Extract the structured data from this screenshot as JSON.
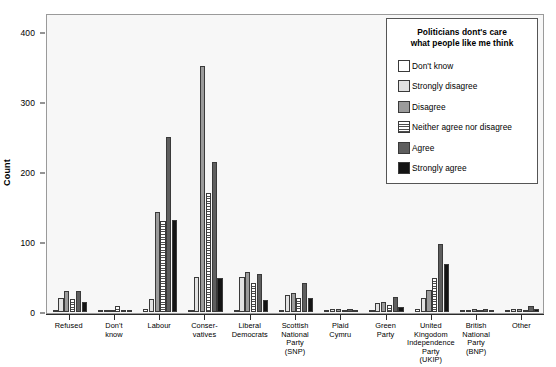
{
  "chart_data": {
    "type": "bar",
    "title": "",
    "xlabel": "",
    "ylabel": "Count",
    "ylim": [
      0,
      430
    ],
    "yticks": [
      0,
      100,
      200,
      300,
      400
    ],
    "ytick_labels": [
      "0",
      "100",
      "200",
      "300",
      "400"
    ],
    "grid": false,
    "legend_position": "top-right",
    "legend_title": "Politicians dont's care\nwhat people like me think",
    "categories": [
      "Refused",
      "Don't\nknow",
      "Labour",
      "Conser-\nvatives",
      "Liberal\nDemocrats",
      "Scottish\nNational\nParty\n(SNP)",
      "Plaid\nCymru",
      "Green\nParty",
      "United\nKingodom\nIndependence\nParty\n(UKIP)",
      "British\nNational\nParty\n(BNP)",
      "Other"
    ],
    "series": [
      {
        "name": "Don't know",
        "color": "#ffffff",
        "swatch": "sw-dontknow",
        "values": [
          3,
          2,
          5,
          3,
          3,
          2,
          1,
          2,
          4,
          1,
          1
        ]
      },
      {
        "name": "Strongly disagree",
        "color": "#e2e2e2",
        "swatch": "sw-strongdis",
        "values": [
          20,
          2,
          18,
          50,
          50,
          25,
          4,
          13,
          20,
          3,
          4
        ]
      },
      {
        "name": "Disagree",
        "color": "#9b9b9b",
        "swatch": "sw-disagree",
        "values": [
          30,
          3,
          143,
          352,
          57,
          27,
          5,
          15,
          32,
          4,
          4
        ]
      },
      {
        "name": "Neither agree nor disagree",
        "color": "#ffffff",
        "swatch": "sw-neither",
        "values": [
          18,
          8,
          130,
          170,
          42,
          20,
          3,
          10,
          48,
          3,
          3
        ]
      },
      {
        "name": "Agree",
        "color": "#5e5e5e",
        "swatch": "sw-agree",
        "values": [
          30,
          3,
          250,
          214,
          55,
          42,
          5,
          22,
          97,
          4,
          9
        ]
      },
      {
        "name": "Strongly agree",
        "color": "#141414",
        "swatch": "sw-strongagr",
        "values": [
          15,
          2,
          131,
          48,
          17,
          20,
          2,
          7,
          68,
          2,
          5
        ]
      }
    ]
  }
}
